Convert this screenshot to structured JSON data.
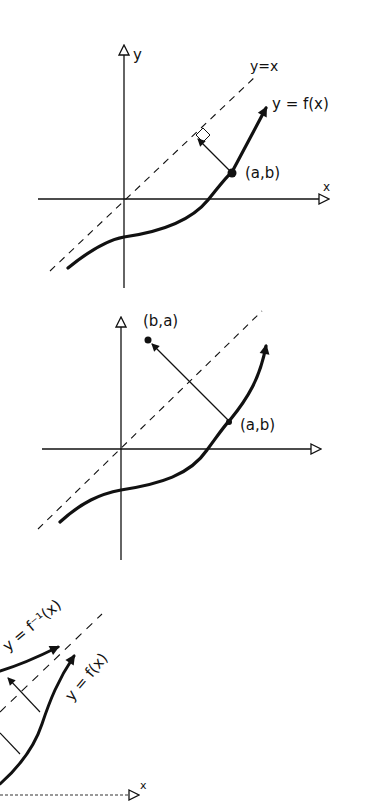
{
  "panels": [
    {
      "id": "panel-1",
      "axis_labels": {
        "y": "y",
        "x": "x"
      },
      "line_label": "y=x",
      "curve_label": "y = f(x)",
      "point_label": "(a,b)"
    },
    {
      "id": "panel-2",
      "reflected_point_label": "(b,a)",
      "point_label": "(a,b)"
    },
    {
      "id": "panel-3",
      "inverse_label": "y = f⁻¹(x)",
      "curve_label": "y = f(x)",
      "axis_labels": {
        "x": "x"
      }
    }
  ],
  "colors": {
    "ink": "#111111",
    "background": "#ffffff"
  }
}
